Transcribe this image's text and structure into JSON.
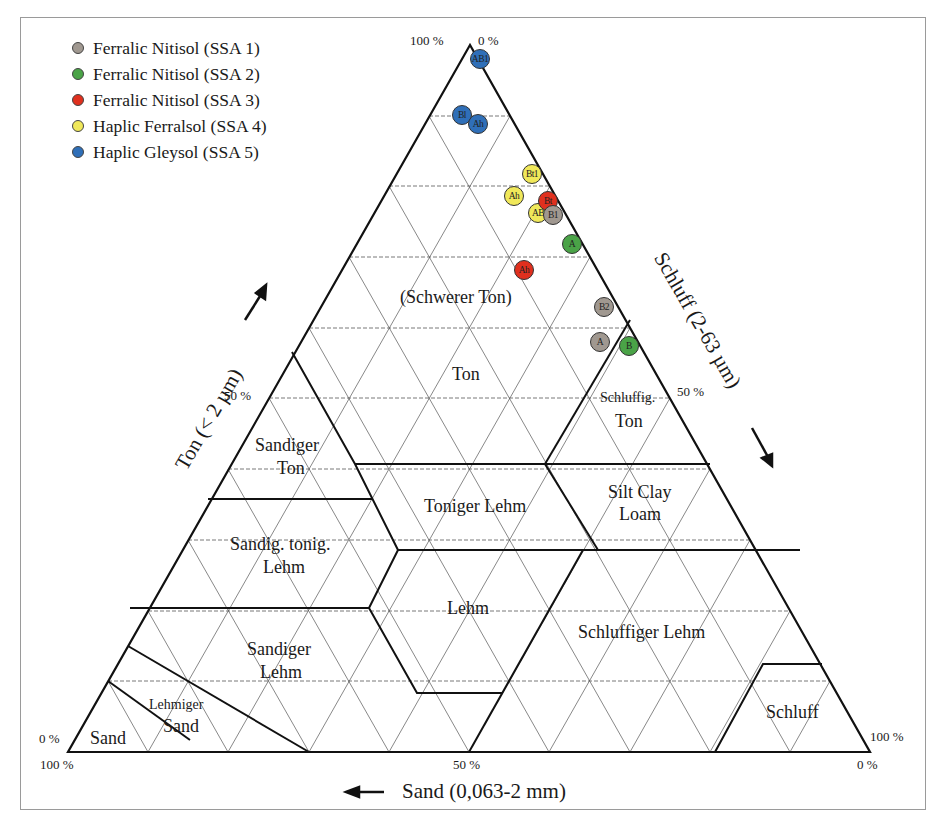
{
  "chart_data": {
    "type": "ternary",
    "title": "",
    "axes": {
      "clay": {
        "label": "Ton (< 2 µm)",
        "arrow": "up",
        "tick_top": "100 %",
        "tick_mid": "50 %",
        "tick_bottom": "0 %"
      },
      "silt": {
        "label": "Schluff (2-63 µm)",
        "arrow": "down",
        "tick_top": "0 %",
        "tick_mid": "50 %",
        "tick_bottom": "100 %"
      },
      "sand": {
        "label": "Sand (0,063-2 mm)",
        "arrow": "left",
        "tick_left": "100 %",
        "tick_mid": "50 %",
        "tick_right": "0 %"
      }
    },
    "grid": true,
    "legend_position": "upper-left",
    "legend": [
      {
        "label": "Ferralic Nitisol (SSA 1)",
        "color": "#a09890"
      },
      {
        "label": "Ferralic Nitisol (SSA 2)",
        "color": "#4aa347"
      },
      {
        "label": "Ferralic Nitisol (SSA 3)",
        "color": "#e0301e"
      },
      {
        "label": "Haplic Ferralsol (SSA 4)",
        "color": "#f0e85a"
      },
      {
        "label": "Haplic Gleysol (SSA 5)",
        "color": "#2f6fb8"
      }
    ],
    "regions": [
      "(Schwerer Ton)",
      "Ton",
      "Schluffig. Ton",
      "Sandiger Ton",
      "Toniger Lehm",
      "Silt Clay Loam",
      "Sandig. tonig. Lehm",
      "Lehm",
      "Sandiger Lehm",
      "Schluffiger Lehm",
      "Lehmiger Sand",
      "Sand",
      "Schluff"
    ],
    "points": [
      {
        "series": "Haplic Gleysol (SSA 5)",
        "horizon": "AB1",
        "clay": 96,
        "silt": 4,
        "sand": 0
      },
      {
        "series": "Haplic Gleysol (SSA 5)",
        "horizon": "Bl",
        "clay": 92,
        "silt": 6,
        "sand": 2
      },
      {
        "series": "Haplic Gleysol (SSA 5)",
        "horizon": "Ah",
        "clay": 91,
        "silt": 8,
        "sand": 1
      },
      {
        "series": "Haplic Ferralsol (SSA 4)",
        "horizon": "Bt1",
        "clay": 82,
        "silt": 15,
        "sand": 3
      },
      {
        "series": "Haplic Ferralsol (SSA 4)",
        "horizon": "Ah",
        "clay": 78,
        "silt": 14,
        "sand": 8
      },
      {
        "series": "Haplic Ferralsol (SSA 4)",
        "horizon": "AB",
        "clay": 76,
        "silt": 19,
        "sand": 5
      },
      {
        "series": "Ferralic Nitisol (SSA 3)",
        "horizon": "Bt",
        "clay": 79,
        "silt": 20,
        "sand": 1
      },
      {
        "series": "Ferralic Nitisol (SSA 3)",
        "horizon": "Ah",
        "clay": 68,
        "silt": 21,
        "sand": 11
      },
      {
        "series": "Ferralic Nitisol (SSA 1)",
        "horizon": "B1",
        "clay": 76,
        "silt": 23,
        "sand": 1
      },
      {
        "series": "Ferralic Nitisol (SSA 1)",
        "horizon": "B2",
        "clay": 61,
        "silt": 38,
        "sand": 1
      },
      {
        "series": "Ferralic Nitisol (SSA 1)",
        "horizon": "A",
        "clay": 57,
        "silt": 41,
        "sand": 2
      },
      {
        "series": "Ferralic Nitisol (SSA 2)",
        "horizon": "A",
        "clay": 72,
        "silt": 28,
        "sand": 0
      },
      {
        "series": "Ferralic Nitisol (SSA 2)",
        "horizon": "B",
        "clay": 56,
        "silt": 44,
        "sand": 0
      }
    ]
  },
  "labels": {
    "clay_axis": "Ton (< 2 µm)",
    "silt_axis": "Schluff (2-63 µm)",
    "sand_axis": "Sand (0,063-2 mm)",
    "apex_left": "100 %",
    "apex_right": "0 %",
    "clay_50": "50 %",
    "silt_50": "50 %",
    "bl_clay0": "0 %",
    "bl_sand100": "100 %",
    "br_silt100": "100 %",
    "br_sand0": "0 %",
    "sand_50": "50 %",
    "arrow_left": "←"
  },
  "regions": {
    "schwerer_ton": "(Schwerer Ton)",
    "ton": "Ton",
    "schluffig": "Schluffig.",
    "schluffig_ton": "Ton",
    "sandiger_ton_1": "Sandiger",
    "sandiger_ton_2": "Ton",
    "toniger_lehm": "Toniger Lehm",
    "silt_clay_1": "Silt Clay",
    "silt_clay_2": "Loam",
    "stl_1": "Sandig. tonig.",
    "stl_2": "Lehm",
    "lehm": "Lehm",
    "sl_1": "Sandiger",
    "sl_2": "Lehm",
    "schluffiger_lehm": "Schluffiger Lehm",
    "ls_1": "Lehmiger",
    "ls_2": "Sand",
    "sand": "Sand",
    "schluff": "Schluff"
  },
  "points": [
    {
      "label": "AB1",
      "x": 480,
      "y": 59,
      "color": "#2f6fb8"
    },
    {
      "label": "Bl",
      "x": 462,
      "y": 115,
      "color": "#2f6fb8"
    },
    {
      "label": "Ah",
      "x": 478,
      "y": 124,
      "color": "#2f6fb8"
    },
    {
      "label": "Bt1",
      "x": 532,
      "y": 174,
      "color": "#f0e85a"
    },
    {
      "label": "Ah",
      "x": 514,
      "y": 196,
      "color": "#f0e85a"
    },
    {
      "label": "AB",
      "x": 538,
      "y": 213,
      "color": "#f0e85a"
    },
    {
      "label": "Bt",
      "x": 548,
      "y": 201,
      "color": "#e0301e"
    },
    {
      "label": "B1",
      "x": 553,
      "y": 215,
      "color": "#a09890"
    },
    {
      "label": "A",
      "x": 572,
      "y": 244,
      "color": "#4aa347"
    },
    {
      "label": "Ah",
      "x": 524,
      "y": 270,
      "color": "#e0301e"
    },
    {
      "label": "B2",
      "x": 604,
      "y": 307,
      "color": "#a09890"
    },
    {
      "label": "A",
      "x": 600,
      "y": 342,
      "color": "#a09890"
    },
    {
      "label": "B",
      "x": 629,
      "y": 346,
      "color": "#4aa347"
    }
  ]
}
